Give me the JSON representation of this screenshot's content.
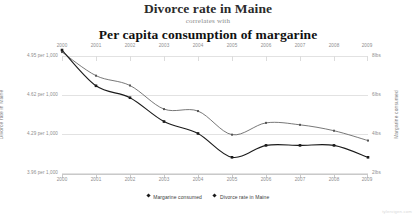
{
  "title": {
    "main": "Divorce rate in Maine",
    "connector": "correlates with",
    "secondary": "Per capita consumption of margarine"
  },
  "watermark": "tylervigen.com",
  "legend": {
    "items": [
      {
        "label": "Margarine consumed",
        "marker": "diamond-marker"
      },
      {
        "label": "Divorce rate in Maine",
        "marker": "diamond-marker"
      }
    ]
  },
  "axes": {
    "left_title": "Divorce rate in Maine",
    "right_title": "Margarine consumed",
    "left_ticks": [
      "4.95 per 1,000",
      "4.62 per 1,000",
      "4.29 per 1,000",
      "3.96 per 1,000"
    ],
    "right_ticks": [
      "8lbs",
      "6lbs",
      "4lbs",
      "2lbs"
    ],
    "x_ticks_top": [
      "2000",
      "2001",
      "2002",
      "2003",
      "2004",
      "2005",
      "2006",
      "2007",
      "2008",
      "2009"
    ],
    "x_ticks_bottom": [
      "2000",
      "2001",
      "2002",
      "2003",
      "2004",
      "2005",
      "2006",
      "2007",
      "2008",
      "2009"
    ]
  },
  "chart_data": {
    "type": "line",
    "title": "Divorce rate in Maine correlates with Per capita consumption of margarine",
    "subtitle": "correlates with",
    "xlabel": "",
    "ylabel": "Divorce rate in Maine",
    "y2label": "Margarine consumed",
    "grid": true,
    "legend_position": "bottom",
    "x": [
      2000,
      2001,
      2002,
      2003,
      2004,
      2005,
      2006,
      2007,
      2008,
      2009
    ],
    "ylim": [
      3.96,
      4.95
    ],
    "y2lim": [
      2,
      8
    ],
    "ytick_values": [
      4.95,
      4.62,
      4.29,
      3.96
    ],
    "y2tick_values": [
      8,
      6,
      4,
      2
    ],
    "series": [
      {
        "name": "Margarine consumed",
        "unit": "lbs",
        "axis": "right",
        "color": "#555555",
        "values": [
          8.2,
          7.0,
          6.5,
          5.3,
          5.2,
          4.0,
          4.6,
          4.5,
          4.2,
          3.7
        ]
      },
      {
        "name": "Divorce rate in Maine",
        "unit": "per 1,000",
        "axis": "left",
        "color": "#1a1a1a",
        "values": [
          5.0,
          4.7,
          4.6,
          4.4,
          4.3,
          4.1,
          4.2,
          4.2,
          4.2,
          4.1
        ]
      }
    ]
  }
}
